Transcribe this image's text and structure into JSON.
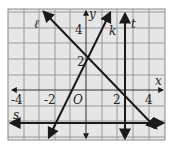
{
  "diagram": {
    "axes": {
      "x_label": "x",
      "y_label": "y"
    },
    "tick_labels": {
      "x": [
        "-4",
        "-2",
        "2",
        "4"
      ],
      "y": [
        "2",
        "4"
      ]
    },
    "origin_label": "O",
    "lines": [
      {
        "name": "ℓ",
        "equation": "y = -x + 2"
      },
      {
        "name": "k",
        "equation": "y = 2x + 2"
      },
      {
        "name": "t",
        "equation": "x = 2.5"
      },
      {
        "name": "s",
        "equation": "y = -2"
      }
    ],
    "colors": {
      "grid_bg": "#e6e6e6",
      "grid_line": "#9a9a9a",
      "line": "#1a1a1a"
    }
  }
}
